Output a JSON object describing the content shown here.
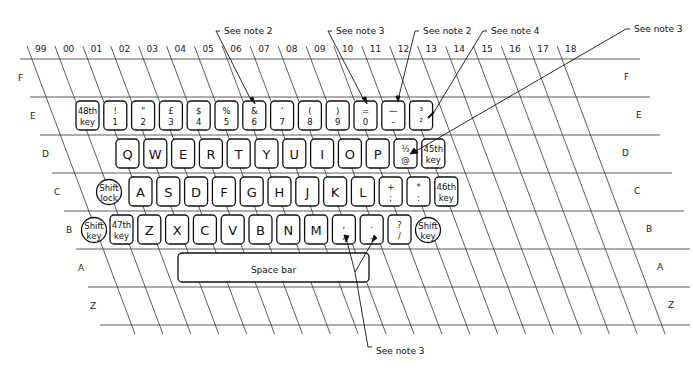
{
  "diagram": {
    "type": "keyboard-layout-grid",
    "column_labels": [
      "99",
      "00",
      "01",
      "02",
      "03",
      "04",
      "05",
      "06",
      "07",
      "08",
      "09",
      "10",
      "11",
      "12",
      "13",
      "14",
      "15",
      "16",
      "17",
      "18"
    ],
    "row_labels": [
      "F",
      "E",
      "D",
      "C",
      "B",
      "A",
      "Z"
    ],
    "rows": {
      "E": [
        {
          "id": "48th",
          "top": "48th",
          "bottom": "key",
          "shape": "rect",
          "col": 0
        },
        {
          "id": "1",
          "top": "!",
          "bottom": "1",
          "shape": "rect",
          "col": 1
        },
        {
          "id": "2",
          "top": "\"",
          "bottom": "2",
          "shape": "rect",
          "col": 2
        },
        {
          "id": "3",
          "top": "£",
          "bottom": "3",
          "shape": "rect",
          "col": 3
        },
        {
          "id": "4",
          "top": "$",
          "bottom": "4",
          "shape": "rect",
          "col": 4
        },
        {
          "id": "5",
          "top": "%",
          "bottom": "5",
          "shape": "rect",
          "col": 5
        },
        {
          "id": "6",
          "top": "&",
          "bottom": "6",
          "shape": "rect",
          "col": 6
        },
        {
          "id": "7",
          "top": "'",
          "bottom": "7",
          "shape": "rect",
          "col": 7
        },
        {
          "id": "8",
          "top": "(",
          "bottom": "8",
          "shape": "rect",
          "col": 8
        },
        {
          "id": "9",
          "top": ")",
          "bottom": "9",
          "shape": "rect",
          "col": 9
        },
        {
          "id": "0",
          "top": "=",
          "bottom": "0",
          "shape": "rect",
          "col": 10
        },
        {
          "id": "minus",
          "top": "—",
          "bottom": "–",
          "shape": "rect",
          "col": 11
        },
        {
          "id": "frac",
          "top": "³",
          "bottom": "²",
          "shape": "rect",
          "col": 12
        }
      ],
      "D": [
        {
          "id": "Q",
          "label": "Q"
        },
        {
          "id": "W",
          "label": "W"
        },
        {
          "id": "E",
          "label": "E"
        },
        {
          "id": "R",
          "label": "R"
        },
        {
          "id": "T",
          "label": "T"
        },
        {
          "id": "Y",
          "label": "Y"
        },
        {
          "id": "U",
          "label": "U"
        },
        {
          "id": "I",
          "label": "I"
        },
        {
          "id": "O",
          "label": "O"
        },
        {
          "id": "P",
          "label": "P"
        },
        {
          "id": "half-at",
          "top": "½",
          "bottom": "@"
        },
        {
          "id": "45th",
          "top": "45th",
          "bottom": "key"
        }
      ],
      "C": [
        {
          "id": "shift-lock",
          "top": "Shift",
          "bottom": "lock",
          "shape": "circle"
        },
        {
          "id": "A",
          "label": "A"
        },
        {
          "id": "S",
          "label": "S"
        },
        {
          "id": "D",
          "label": "D"
        },
        {
          "id": "F",
          "label": "F"
        },
        {
          "id": "G",
          "label": "G"
        },
        {
          "id": "H",
          "label": "H"
        },
        {
          "id": "J",
          "label": "J"
        },
        {
          "id": "K",
          "label": "K"
        },
        {
          "id": "L",
          "label": "L"
        },
        {
          "id": "semicolon",
          "top": "+",
          "bottom": ";"
        },
        {
          "id": "colon",
          "top": "*",
          "bottom": ":"
        },
        {
          "id": "46th",
          "top": "46th",
          "bottom": "key"
        }
      ],
      "B": [
        {
          "id": "shift-left",
          "top": "Shift",
          "bottom": "key",
          "shape": "circle"
        },
        {
          "id": "47th",
          "top": "47th",
          "bottom": "key"
        },
        {
          "id": "Z",
          "label": "Z"
        },
        {
          "id": "X",
          "label": "X"
        },
        {
          "id": "C",
          "label": "C"
        },
        {
          "id": "V",
          "label": "V"
        },
        {
          "id": "B",
          "label": "B"
        },
        {
          "id": "N",
          "label": "N"
        },
        {
          "id": "M",
          "label": "M"
        },
        {
          "id": "comma",
          "top": ",",
          "bottom": ","
        },
        {
          "id": "period",
          "top": ".",
          "bottom": "."
        },
        {
          "id": "slash",
          "top": "?",
          "bottom": "/"
        },
        {
          "id": "shift-right",
          "top": "Shift",
          "bottom": "key",
          "shape": "circle"
        }
      ],
      "A": [
        {
          "id": "space",
          "label": "Space bar"
        }
      ]
    },
    "notes": [
      {
        "id": "note2-6",
        "text": "See note 2"
      },
      {
        "id": "note3-0",
        "text": "See note 3"
      },
      {
        "id": "note2-minus",
        "text": "See note 2"
      },
      {
        "id": "note4",
        "text": "See note 4"
      },
      {
        "id": "note3-right",
        "text": "See note 3"
      },
      {
        "id": "note3-bottom",
        "text": "See note 3"
      }
    ]
  }
}
